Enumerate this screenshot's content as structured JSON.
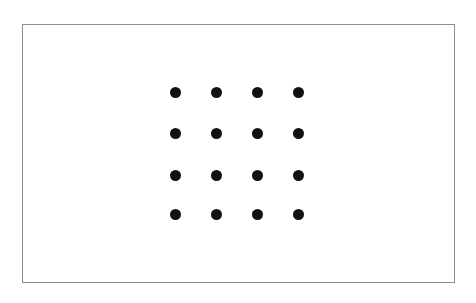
{
  "figure": {
    "type": "dot-grid-figure",
    "background_color": "#ffffff",
    "frame": {
      "x": 22,
      "y": 24,
      "width": 433,
      "height": 259,
      "border_color": "#8c8c8c",
      "border_width": 1,
      "fill_color": "#ffffff"
    },
    "dot_grid": {
      "rows": 4,
      "cols": 4,
      "dot_count": 16,
      "dot_color": "#111111",
      "dot_diameter": 11,
      "col_centers_x": [
        175,
        216,
        257,
        298
      ],
      "row_centers_y": [
        92,
        133,
        175,
        214
      ]
    }
  }
}
